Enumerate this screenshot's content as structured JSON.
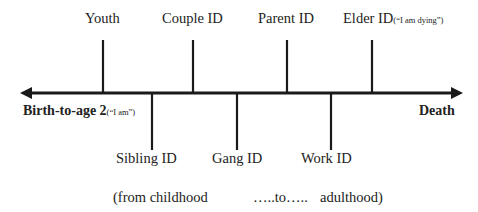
{
  "diagram": {
    "type": "timeline",
    "axis": {
      "start_label": "Birth-to-age 2",
      "start_note": "(“I am”)",
      "end_label": "Death",
      "direction": "bidirectional-arrow"
    },
    "upper_markers": [
      {
        "label": "Youth",
        "note": ""
      },
      {
        "label": "Couple ID",
        "note": ""
      },
      {
        "label": "Parent ID",
        "note": ""
      },
      {
        "label": "Elder ID",
        "note": "(“I am dying”)"
      }
    ],
    "lower_markers": [
      {
        "label": "Sibling ID"
      },
      {
        "label": "Gang ID"
      },
      {
        "label": "Work ID"
      }
    ],
    "caption": {
      "left": "(from childhood",
      "middle": "…..to…..",
      "right": "adulthood)"
    },
    "colors": {
      "line": "#1a1a1a",
      "text": "#222222",
      "background": "#ffffff"
    }
  }
}
